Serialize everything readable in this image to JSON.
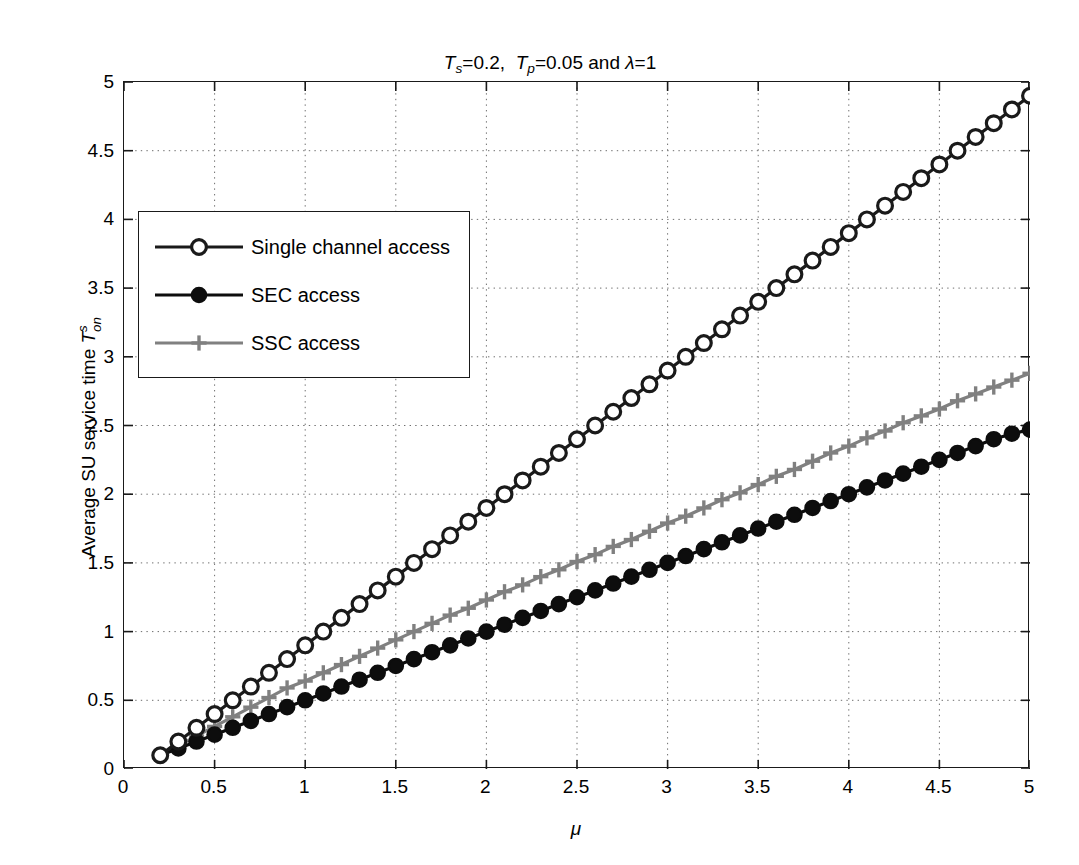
{
  "chart_data": {
    "type": "line",
    "title_parts": {
      "t1_sym": "T",
      "t1_sub": "s",
      "t1_eq": "=0.2,  ",
      "t2_sym": "T",
      "t2_sub": "p",
      "t2_eq": "=0.05 and ",
      "lambda": "λ",
      "lambda_eq": "=1"
    },
    "xlabel": "μ",
    "ylabel_text": "Average SU service time ",
    "ylabel_sym": "T",
    "ylabel_sup": "s",
    "ylabel_sub": "on",
    "xlim": [
      0,
      5
    ],
    "ylim": [
      0,
      5
    ],
    "xticks": [
      0,
      0.5,
      1,
      1.5,
      2,
      2.5,
      3,
      3.5,
      4,
      4.5,
      5
    ],
    "xticklabels": [
      "0",
      "0.5",
      "1",
      "1.5",
      "2",
      "2.5",
      "3",
      "3.5",
      "4",
      "4.5",
      "5"
    ],
    "yticks": [
      0,
      0.5,
      1,
      1.5,
      2,
      2.5,
      3,
      3.5,
      4,
      4.5,
      5
    ],
    "yticklabels": [
      "0",
      "0.5",
      "1",
      "1.5",
      "2",
      "2.5",
      "3",
      "3.5",
      "4",
      "4.5",
      "5"
    ],
    "grid": true,
    "grid_style": "dotted",
    "legend_position": "upper left",
    "x": [
      0.2,
      0.3,
      0.4,
      0.5,
      0.6,
      0.7,
      0.8,
      0.9,
      1.0,
      1.1,
      1.2,
      1.3,
      1.4,
      1.5,
      1.6,
      1.7,
      1.8,
      1.9,
      2.0,
      2.1,
      2.2,
      2.3,
      2.4,
      2.5,
      2.6,
      2.7,
      2.8,
      2.9,
      3.0,
      3.1,
      3.2,
      3.3,
      3.4,
      3.5,
      3.6,
      3.7,
      3.8,
      3.9,
      4.0,
      4.1,
      4.2,
      4.3,
      4.4,
      4.5,
      4.6,
      4.7,
      4.8,
      4.9,
      5.0
    ],
    "series": [
      {
        "name": "Single channel access",
        "color": "#1a1a1a",
        "marker": "circle-open",
        "values": [
          0.1,
          0.2,
          0.3,
          0.4,
          0.5,
          0.6,
          0.7,
          0.8,
          0.9,
          1.0,
          1.1,
          1.2,
          1.3,
          1.4,
          1.5,
          1.6,
          1.7,
          1.8,
          1.9,
          2.0,
          2.1,
          2.2,
          2.3,
          2.4,
          2.5,
          2.6,
          2.7,
          2.8,
          2.9,
          3.0,
          3.1,
          3.2,
          3.3,
          3.4,
          3.5,
          3.6,
          3.7,
          3.8,
          3.9,
          4.0,
          4.1,
          4.2,
          4.3,
          4.4,
          4.5,
          4.6,
          4.7,
          4.8,
          4.9
        ]
      },
      {
        "name": "SEC access",
        "color": "#0d0d0d",
        "marker": "circle-filled",
        "values": [
          0.1,
          0.15,
          0.2,
          0.25,
          0.3,
          0.35,
          0.4,
          0.45,
          0.5,
          0.55,
          0.6,
          0.65,
          0.7,
          0.75,
          0.8,
          0.85,
          0.9,
          0.95,
          1.0,
          1.05,
          1.1,
          1.15,
          1.2,
          1.25,
          1.3,
          1.35,
          1.4,
          1.45,
          1.5,
          1.55,
          1.6,
          1.65,
          1.7,
          1.75,
          1.8,
          1.85,
          1.9,
          1.95,
          2.0,
          2.05,
          2.1,
          2.15,
          2.2,
          2.25,
          2.3,
          2.35,
          2.4,
          2.44,
          2.47
        ]
      },
      {
        "name": "SSC access",
        "color": "#808080",
        "marker": "plus",
        "values": [
          0.1,
          0.17,
          0.24,
          0.31,
          0.38,
          0.45,
          0.52,
          0.59,
          0.64,
          0.7,
          0.76,
          0.82,
          0.88,
          0.94,
          1.0,
          1.06,
          1.12,
          1.17,
          1.23,
          1.29,
          1.34,
          1.4,
          1.45,
          1.51,
          1.56,
          1.62,
          1.67,
          1.73,
          1.79,
          1.84,
          1.9,
          1.96,
          2.01,
          2.07,
          2.13,
          2.18,
          2.24,
          2.3,
          2.35,
          2.41,
          2.46,
          2.52,
          2.57,
          2.62,
          2.68,
          2.73,
          2.78,
          2.83,
          2.88
        ]
      }
    ]
  },
  "legend": {
    "items": [
      {
        "label": "Single channel access",
        "marker": "circle-open",
        "color": "#1a1a1a"
      },
      {
        "label": "SEC access",
        "marker": "circle-filled",
        "color": "#0d0d0d"
      },
      {
        "label": "SSC access",
        "marker": "plus",
        "color": "#808080"
      }
    ]
  }
}
